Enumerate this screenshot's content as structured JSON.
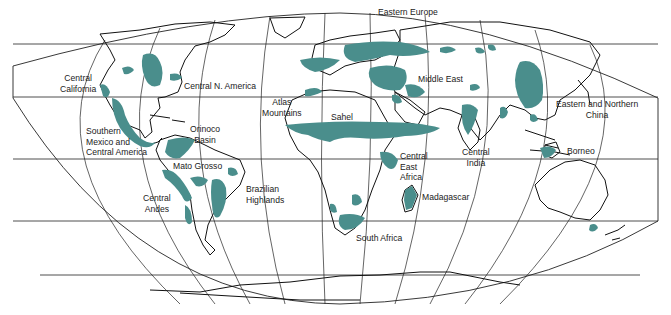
{
  "map": {
    "type": "world-map",
    "projection": "pseudocylindrical-equal-area",
    "fill_color": "#4a8e8c",
    "line_color": "#111111",
    "background": "#ffffff",
    "regions": [
      {
        "id": "central-california",
        "label": "Central\nCalifornia"
      },
      {
        "id": "central-n-america",
        "label": "Central N. America"
      },
      {
        "id": "southern-mexico",
        "label": "Southern\nMexico and\nCentral America"
      },
      {
        "id": "orinoco-basin",
        "label": "Orinoco\nBasin"
      },
      {
        "id": "mato-grosso",
        "label": "Mato Grosso"
      },
      {
        "id": "central-andes",
        "label": "Central\nAndes"
      },
      {
        "id": "brazilian-highlands",
        "label": "Brazilian\nHighlands"
      },
      {
        "id": "atlas-mountains",
        "label": "Atlas\nMountains"
      },
      {
        "id": "sahel",
        "label": "Sahel"
      },
      {
        "id": "central-east-africa",
        "label": "Central\nEast\nAfrica"
      },
      {
        "id": "madagascar",
        "label": "Madagascar"
      },
      {
        "id": "south-africa",
        "label": "South Africa"
      },
      {
        "id": "eastern-europe",
        "label": "Eastern Europe"
      },
      {
        "id": "middle-east",
        "label": "Middle East"
      },
      {
        "id": "central-india",
        "label": "Central\nIndia"
      },
      {
        "id": "eastern-northern-china",
        "label": "Eastern and Northern\nChina"
      },
      {
        "id": "borneo",
        "label": "Borneo"
      }
    ]
  },
  "labels": {
    "central_california_1": "Central",
    "central_california_2": "California",
    "central_n_america": "Central N. America",
    "southern_mexico_1": "Southern",
    "southern_mexico_2": "Mexico and",
    "southern_mexico_3": "Central America",
    "orinoco_1": "Orinoco",
    "orinoco_2": "Basin",
    "mato_grosso": "Mato Grosso",
    "central_andes_1": "Central",
    "central_andes_2": "Andes",
    "brazilian_1": "Brazilian",
    "brazilian_2": "Highlands",
    "atlas_1": "Atlas",
    "atlas_2": "Mountains",
    "sahel": "Sahel",
    "cea_1": "Central",
    "cea_2": "East",
    "cea_3": "Africa",
    "madagascar": "Madagascar",
    "south_africa": "South Africa",
    "eastern_europe": "Eastern Europe",
    "middle_east": "Middle East",
    "central_india_1": "Central",
    "central_india_2": "India",
    "china_1": "Eastern and Northern",
    "china_2": "China",
    "borneo": "Borneo"
  }
}
